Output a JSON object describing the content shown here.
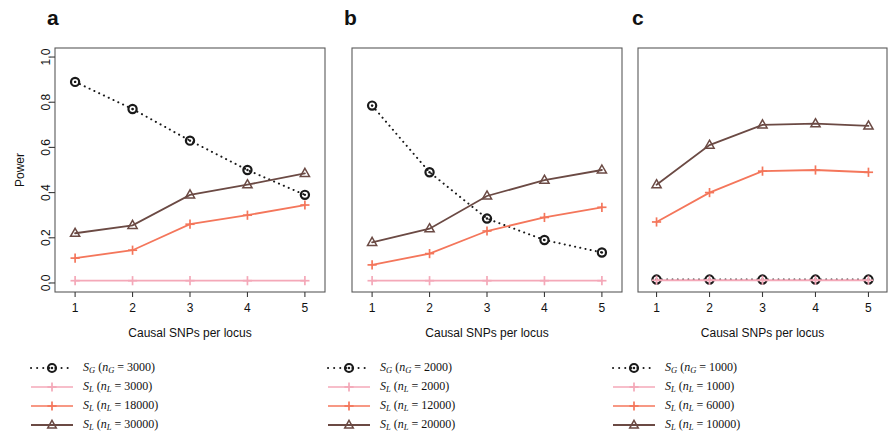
{
  "figure": {
    "panels": [
      {
        "label": "a",
        "xlabel": "Causal SNPs per locus",
        "ylabel": "Power",
        "legend": [
          {
            "symbol": "circle-dotted",
            "color": "#1a1a1a",
            "stat": "S",
            "stat_sub": "G",
            "n_sym": "n",
            "n_sub": "G",
            "n_value": "3000",
            "text": "S_G (n_G = 3000)"
          },
          {
            "symbol": "cross-pale",
            "color": "#f4a8b8",
            "stat": "S",
            "stat_sub": "L",
            "n_sym": "n",
            "n_sub": "L",
            "n_value": "3000",
            "text": "S_L (n_L = 3000)"
          },
          {
            "symbol": "cross-coral",
            "color": "#f4765b",
            "stat": "S",
            "stat_sub": "L",
            "n_sym": "n",
            "n_sub": "L",
            "n_value": "18000",
            "text": "S_L (n_L = 18000)"
          },
          {
            "symbol": "triangle-brown",
            "color": "#6b4a44",
            "stat": "S",
            "stat_sub": "L",
            "n_sym": "n",
            "n_sub": "L",
            "n_value": "30000",
            "text": "S_L (n_L = 30000)"
          }
        ]
      },
      {
        "label": "b",
        "xlabel": "Causal SNPs per locus",
        "ylabel": "",
        "legend": [
          {
            "symbol": "circle-dotted",
            "color": "#1a1a1a",
            "stat": "S",
            "stat_sub": "G",
            "n_sym": "n",
            "n_sub": "G",
            "n_value": "2000",
            "text": "S_G (n_G = 2000)"
          },
          {
            "symbol": "cross-pale",
            "color": "#f4a8b8",
            "stat": "S",
            "stat_sub": "L",
            "n_sym": "n",
            "n_sub": "L",
            "n_value": "2000",
            "text": "S_L (n_L = 2000)"
          },
          {
            "symbol": "cross-coral",
            "color": "#f4765b",
            "stat": "S",
            "stat_sub": "L",
            "n_sym": "n",
            "n_sub": "L",
            "n_value": "12000",
            "text": "S_L (n_L = 12000)"
          },
          {
            "symbol": "triangle-brown",
            "color": "#6b4a44",
            "stat": "S",
            "stat_sub": "L",
            "n_sym": "n",
            "n_sub": "L",
            "n_value": "20000",
            "text": "S_L (n_L = 20000)"
          }
        ]
      },
      {
        "label": "c",
        "xlabel": "Causal SNPs per locus",
        "ylabel": "",
        "legend": [
          {
            "symbol": "circle-dotted",
            "color": "#1a1a1a",
            "stat": "S",
            "stat_sub": "G",
            "n_sym": "n",
            "n_sub": "G",
            "n_value": "1000",
            "text": "S_G (n_G = 1000)"
          },
          {
            "symbol": "cross-pale",
            "color": "#f4a8b8",
            "stat": "S",
            "stat_sub": "L",
            "n_sym": "n",
            "n_sub": "L",
            "n_value": "1000",
            "text": "S_L (n_L = 1000)"
          },
          {
            "symbol": "cross-coral",
            "color": "#f4765b",
            "stat": "S",
            "stat_sub": "L",
            "n_sym": "n",
            "n_sub": "L",
            "n_value": "6000",
            "text": "S_L (n_L = 6000)"
          },
          {
            "symbol": "triangle-brown",
            "color": "#6b4a44",
            "stat": "S",
            "stat_sub": "L",
            "n_sym": "n",
            "n_sub": "L",
            "n_value": "10000",
            "text": "S_L (n_L = 10000)"
          }
        ]
      }
    ]
  },
  "chart_data": [
    {
      "type": "line",
      "panel": "a",
      "title": "",
      "xlabel": "Causal SNPs per locus",
      "ylabel": "Power",
      "x": [
        1,
        2,
        3,
        4,
        5
      ],
      "xticklabels": [
        "1",
        "2",
        "3",
        "4",
        "5"
      ],
      "yticklabels": [
        "0.0",
        "0.2",
        "0.4",
        "0.6",
        "0.8",
        "1.0"
      ],
      "yticks": [
        0.0,
        0.2,
        0.4,
        0.6,
        0.8,
        1.0
      ],
      "xlim": [
        0.65,
        5.35
      ],
      "ylim": [
        -0.04,
        1.04
      ],
      "grid": false,
      "legend_position": "below",
      "series": [
        {
          "name": "S_G (n_G = 3000)",
          "color": "#1a1a1a",
          "linestyle": "dotted",
          "marker": "circle",
          "values": [
            0.89,
            0.77,
            0.63,
            0.5,
            0.39
          ]
        },
        {
          "name": "S_L (n_L = 3000)",
          "color": "#f4a8b8",
          "linestyle": "solid",
          "marker": "cross",
          "values": [
            0.01,
            0.01,
            0.01,
            0.01,
            0.01
          ]
        },
        {
          "name": "S_L (n_L = 18000)",
          "color": "#f4765b",
          "linestyle": "solid",
          "marker": "cross",
          "values": [
            0.11,
            0.145,
            0.26,
            0.3,
            0.345
          ]
        },
        {
          "name": "S_L (n_L = 30000)",
          "color": "#6b4a44",
          "linestyle": "solid",
          "marker": "triangle",
          "values": [
            0.22,
            0.255,
            0.39,
            0.435,
            0.485
          ]
        }
      ]
    },
    {
      "type": "line",
      "panel": "b",
      "title": "",
      "xlabel": "Causal SNPs per locus",
      "ylabel": "",
      "x": [
        1,
        2,
        3,
        4,
        5
      ],
      "xticklabels": [
        "1",
        "2",
        "3",
        "4",
        "5"
      ],
      "yticks": [
        0.0,
        0.2,
        0.4,
        0.6,
        0.8,
        1.0
      ],
      "xlim": [
        0.65,
        5.35
      ],
      "ylim": [
        -0.04,
        1.04
      ],
      "grid": false,
      "legend_position": "below",
      "series": [
        {
          "name": "S_G (n_G = 2000)",
          "color": "#1a1a1a",
          "linestyle": "dotted",
          "marker": "circle",
          "values": [
            0.785,
            0.49,
            0.285,
            0.19,
            0.135
          ]
        },
        {
          "name": "S_L (n_L = 2000)",
          "color": "#f4a8b8",
          "linestyle": "solid",
          "marker": "cross",
          "values": [
            0.01,
            0.01,
            0.01,
            0.01,
            0.01
          ]
        },
        {
          "name": "S_L (n_L = 12000)",
          "color": "#f4765b",
          "linestyle": "solid",
          "marker": "cross",
          "values": [
            0.08,
            0.13,
            0.23,
            0.29,
            0.335
          ]
        },
        {
          "name": "S_L (n_L = 20000)",
          "color": "#6b4a44",
          "linestyle": "solid",
          "marker": "triangle",
          "values": [
            0.18,
            0.24,
            0.385,
            0.455,
            0.5
          ]
        }
      ]
    },
    {
      "type": "line",
      "panel": "c",
      "title": "",
      "xlabel": "Causal SNPs per locus",
      "ylabel": "",
      "x": [
        1,
        2,
        3,
        4,
        5
      ],
      "xticklabels": [
        "1",
        "2",
        "3",
        "4",
        "5"
      ],
      "yticks": [
        0.0,
        0.2,
        0.4,
        0.6,
        0.8,
        1.0
      ],
      "xlim": [
        0.65,
        5.35
      ],
      "ylim": [
        -0.04,
        1.04
      ],
      "grid": false,
      "legend_position": "below",
      "series": [
        {
          "name": "S_G (n_G = 1000)",
          "color": "#1a1a1a",
          "linestyle": "dotted",
          "marker": "circle",
          "values": [
            0.015,
            0.015,
            0.015,
            0.015,
            0.015
          ]
        },
        {
          "name": "S_L (n_L = 1000)",
          "color": "#f4a8b8",
          "linestyle": "solid",
          "marker": "cross",
          "values": [
            0.012,
            0.012,
            0.012,
            0.012,
            0.012
          ]
        },
        {
          "name": "S_L (n_L = 6000)",
          "color": "#f4765b",
          "linestyle": "solid",
          "marker": "cross",
          "values": [
            0.27,
            0.4,
            0.495,
            0.5,
            0.49
          ]
        },
        {
          "name": "S_L (n_L = 10000)",
          "color": "#6b4a44",
          "linestyle": "solid",
          "marker": "triangle",
          "values": [
            0.435,
            0.61,
            0.7,
            0.705,
            0.695
          ]
        }
      ]
    }
  ]
}
